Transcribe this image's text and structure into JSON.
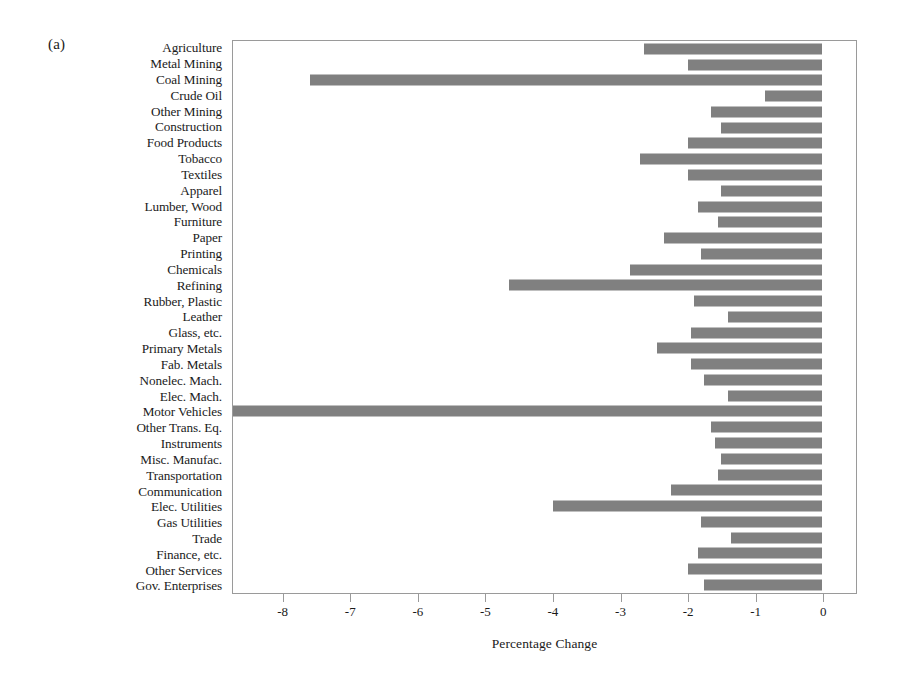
{
  "figure": {
    "panel_label": "(a)",
    "xlabel": "Percentage Change",
    "bar_color": "#808080",
    "frame_color": "#9a9a9a"
  },
  "chart_data": {
    "type": "bar",
    "orientation": "horizontal",
    "title": "",
    "subtitle": "",
    "xlabel": "Percentage Change",
    "ylabel": "",
    "xlim": [
      -8.75,
      0.5
    ],
    "ylim": null,
    "grid": false,
    "legend": null,
    "annotations": [
      "(a)"
    ],
    "xticks": [
      -8,
      -7,
      -6,
      -5,
      -4,
      -3,
      -2,
      -1,
      0
    ],
    "xticklabels": [
      "-8",
      "-7",
      "-6",
      "-5",
      "-4",
      "-3",
      "-2",
      "-1",
      "0"
    ],
    "categories": [
      "Agriculture",
      "Metal Mining",
      "Coal Mining",
      "Crude Oil",
      "Other Mining",
      "Construction",
      "Food Products",
      "Tobacco",
      "Textiles",
      "Apparel",
      "Lumber, Wood",
      "Furniture",
      "Paper",
      "Printing",
      "Chemicals",
      "Refining",
      "Rubber, Plastic",
      "Leather",
      "Glass, etc.",
      "Primary Metals",
      "Fab. Metals",
      "Nonelec. Mach.",
      "Elec. Mach.",
      "Motor Vehicles",
      "Other Trans. Eq.",
      "Instruments",
      "Misc. Manufac.",
      "Transportation",
      "Communication",
      "Elec. Utilities",
      "Gas Utilities",
      "Trade",
      "Finance, etc.",
      "Other Services",
      "Gov. Enterprises"
    ],
    "values": [
      -2.65,
      -2.0,
      -7.6,
      -0.85,
      -1.65,
      -1.5,
      -2.0,
      -2.7,
      -2.0,
      -1.5,
      -1.85,
      -1.55,
      -2.35,
      -1.8,
      -2.85,
      -4.65,
      -1.9,
      -1.4,
      -1.95,
      -2.45,
      -1.95,
      -1.75,
      -1.4,
      -8.75,
      -1.65,
      -1.6,
      -1.5,
      -1.55,
      -2.25,
      -4.0,
      -1.8,
      -1.35,
      -1.85,
      -2.0,
      -1.75
    ]
  }
}
